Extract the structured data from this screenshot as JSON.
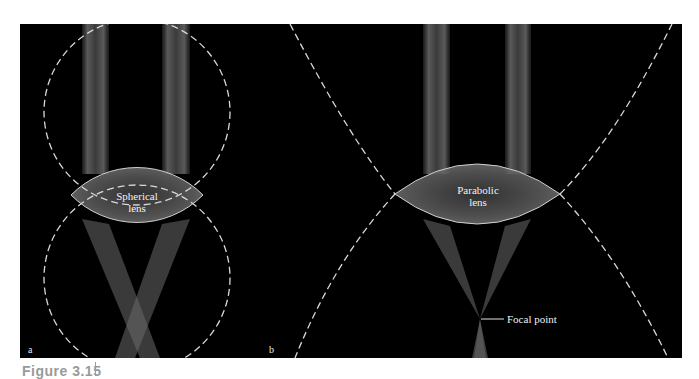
{
  "figure": {
    "caption": "Figure 3.15",
    "background_color": "#000000",
    "panels": [
      {
        "id": "a",
        "letter": "a",
        "lens_label_line1": "Spherical",
        "lens_label_line2": "lens",
        "guide_shape": "two dashed circles"
      },
      {
        "id": "b",
        "letter": "b",
        "lens_label_line1": "Parabolic",
        "lens_label_line2": "lens",
        "guide_shape": "two dashed parabolas",
        "annotation": "Focal point"
      }
    ],
    "colors": {
      "dashed_guide": "#d8d8d8",
      "lens_outline": "#cfcfcf",
      "beam": "#5a5a5a",
      "text": "#f2f2f2"
    }
  }
}
